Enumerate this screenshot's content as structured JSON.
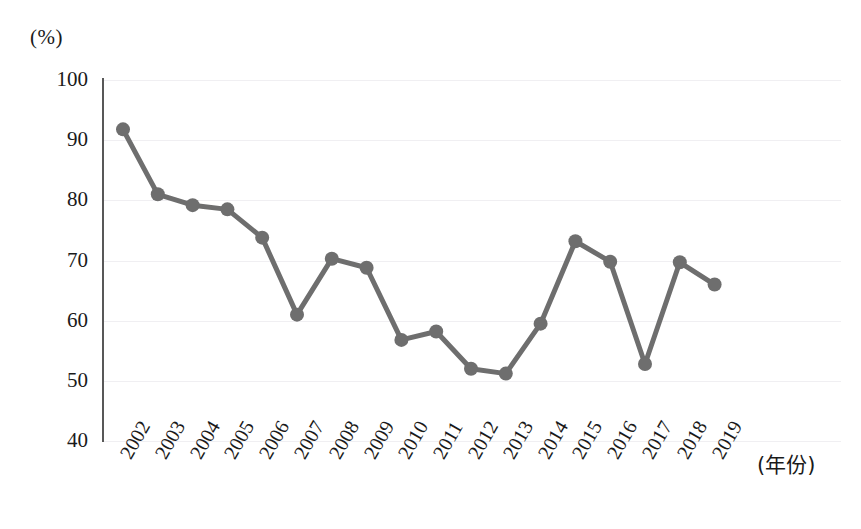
{
  "chart_data": {
    "type": "line",
    "title": "",
    "subtitle": "",
    "xlabel": "(年份)",
    "ylabel": "(%)",
    "ylim": [
      40,
      100
    ],
    "ytick_step": 10,
    "yticks": [
      100,
      90,
      80,
      70,
      60,
      50,
      40
    ],
    "grid": true,
    "grid_axis": "y",
    "legend": false,
    "legend_position": "none",
    "categories": [
      "2002",
      "2003",
      "2004",
      "2005",
      "2006",
      "2007",
      "2008",
      "2009",
      "2010",
      "2011",
      "2012",
      "2013",
      "2014",
      "2015",
      "2016",
      "2017",
      "2018",
      "2019"
    ],
    "x": [
      2002,
      2003,
      2004,
      2005,
      2006,
      2007,
      2008,
      2009,
      2010,
      2011,
      2012,
      2013,
      2014,
      2015,
      2016,
      2017,
      2018,
      2019
    ],
    "values": [
      91.8,
      81.0,
      79.2,
      78.5,
      73.8,
      61.0,
      70.3,
      68.8,
      56.8,
      58.2,
      52.0,
      51.2,
      59.5,
      73.2,
      69.8,
      52.8,
      69.7,
      66.0
    ],
    "series": [
      {
        "name": "",
        "values": [
          91.8,
          81.0,
          79.2,
          78.5,
          73.8,
          61.0,
          70.3,
          68.8,
          56.8,
          58.2,
          52.0,
          51.2,
          59.5,
          73.2,
          69.8,
          52.8,
          69.7,
          66.0
        ],
        "color": "#6e6e6e",
        "marker": "circle",
        "marker_size": 11,
        "line_width": 5
      }
    ],
    "annotations": [],
    "x_tick_rotation": -60,
    "colors": {
      "series": "#6e6e6e",
      "axis": "#585858",
      "grid": "#f0eff2",
      "text": "#1a1a1a",
      "background": "#ffffff"
    }
  }
}
